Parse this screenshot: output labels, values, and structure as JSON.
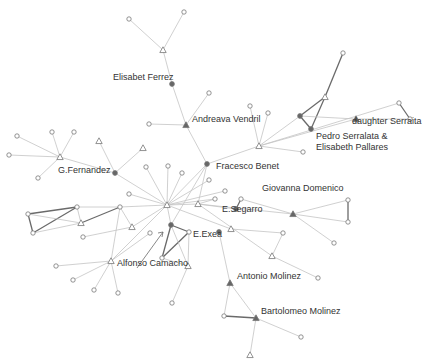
{
  "diagram": {
    "type": "social-network",
    "colors": {
      "edge_light": "#c4c4c4",
      "edge_dark": "#6a6a6a",
      "node_stroke": "#777777",
      "node_fill_dark": "#666666",
      "label": "#333333"
    },
    "labels": [
      {
        "id": "elisabet_ferrez",
        "text": "Elisabet Ferrez",
        "x": 113,
        "y": 78
      },
      {
        "id": "andreava_vendril",
        "text": "Andreava Vendril",
        "x": 192,
        "y": 120
      },
      {
        "id": "pedro_elisabeth_1",
        "text": "Pedro Serralata &",
        "x": 316,
        "y": 137
      },
      {
        "id": "pedro_elisabeth_2",
        "text": "Elisabeth Pallares",
        "x": 316,
        "y": 148
      },
      {
        "id": "daughter_serralta",
        "text": "daughter Serraita",
        "x": 352,
        "y": 122
      },
      {
        "id": "g_fernandez",
        "text": "G.Fernandez",
        "x": 58,
        "y": 171
      },
      {
        "id": "fracesco_benet",
        "text": "Fracesco Benet",
        "x": 216,
        "y": 167
      },
      {
        "id": "giovanna_domenico",
        "text": "Giovanna Domenico",
        "x": 262,
        "y": 189
      },
      {
        "id": "e_segarro",
        "text": "E.Segarro",
        "x": 222,
        "y": 210
      },
      {
        "id": "e_exea",
        "text": "E.Exea",
        "x": 193,
        "y": 235
      },
      {
        "id": "alfonso_camacho",
        "text": "Alfonso Camacho",
        "x": 117,
        "y": 264
      },
      {
        "id": "antonio_molinez",
        "text": "Antonio Molinez",
        "x": 237,
        "y": 277
      },
      {
        "id": "bartolomeo_molinez",
        "text": "Bartolomeo Molinez",
        "x": 261,
        "y": 312
      }
    ],
    "nodes": [
      {
        "id": "n1",
        "shape": "circle",
        "x": 129,
        "y": 19
      },
      {
        "id": "n2",
        "shape": "circle",
        "x": 184,
        "y": 12
      },
      {
        "id": "n3",
        "shape": "triangle",
        "x": 163,
        "y": 50
      },
      {
        "id": "elisabet",
        "shape": "dot",
        "x": 172,
        "y": 84
      },
      {
        "id": "andreava",
        "shape": "filled-triangle",
        "x": 186,
        "y": 125
      },
      {
        "id": "n4",
        "shape": "circle",
        "x": 149,
        "y": 124
      },
      {
        "id": "n5",
        "shape": "circle",
        "x": 209,
        "y": 93
      },
      {
        "id": "fracesco",
        "shape": "dot",
        "x": 207,
        "y": 164
      },
      {
        "id": "hub2",
        "shape": "triangle",
        "x": 259,
        "y": 146
      },
      {
        "id": "n6",
        "shape": "circle",
        "x": 250,
        "y": 106
      },
      {
        "id": "n7",
        "shape": "circle",
        "x": 268,
        "y": 113
      },
      {
        "id": "n8",
        "shape": "circle",
        "x": 303,
        "y": 152
      },
      {
        "id": "pedro",
        "shape": "dot",
        "x": 300,
        "y": 116
      },
      {
        "id": "elisabeth_p",
        "shape": "dot",
        "x": 311,
        "y": 129
      },
      {
        "id": "n9",
        "shape": "triangle",
        "x": 325,
        "y": 97
      },
      {
        "id": "n10",
        "shape": "circle",
        "x": 343,
        "y": 53
      },
      {
        "id": "daughter",
        "shape": "filled-triangle",
        "x": 356,
        "y": 119
      },
      {
        "id": "n11",
        "shape": "circle",
        "x": 399,
        "y": 103
      },
      {
        "id": "n12",
        "shape": "circle",
        "x": 410,
        "y": 119
      },
      {
        "id": "gfern",
        "shape": "triangle",
        "x": 60,
        "y": 157
      },
      {
        "id": "n13",
        "shape": "circle",
        "x": 17,
        "y": 136
      },
      {
        "id": "n14",
        "shape": "circle",
        "x": 9,
        "y": 155
      },
      {
        "id": "n15",
        "shape": "circle",
        "x": 52,
        "y": 132
      },
      {
        "id": "n16",
        "shape": "circle",
        "x": 74,
        "y": 132
      },
      {
        "id": "n17",
        "shape": "circle",
        "x": 38,
        "y": 178
      },
      {
        "id": "n18",
        "shape": "dot",
        "x": 115,
        "y": 173
      },
      {
        "id": "n19",
        "shape": "triangle",
        "x": 99,
        "y": 141
      },
      {
        "id": "n20",
        "shape": "triangle",
        "x": 143,
        "y": 148
      },
      {
        "id": "n21",
        "shape": "circle",
        "x": 146,
        "y": 167
      },
      {
        "id": "n22",
        "shape": "circle",
        "x": 168,
        "y": 166
      },
      {
        "id": "hub1",
        "shape": "triangle",
        "x": 167,
        "y": 205
      },
      {
        "id": "n23",
        "shape": "triangle",
        "x": 198,
        "y": 204
      },
      {
        "id": "n24",
        "shape": "circle",
        "x": 129,
        "y": 194
      },
      {
        "id": "n25",
        "shape": "circle",
        "x": 215,
        "y": 199
      },
      {
        "id": "n26",
        "shape": "circle",
        "x": 225,
        "y": 191
      },
      {
        "id": "n27",
        "shape": "circle",
        "x": 209,
        "y": 180
      },
      {
        "id": "n28",
        "shape": "circle",
        "x": 182,
        "y": 173
      },
      {
        "id": "n29",
        "shape": "circle",
        "x": 28,
        "y": 214
      },
      {
        "id": "n30",
        "shape": "circle",
        "x": 33,
        "y": 233
      },
      {
        "id": "n31",
        "shape": "circle",
        "x": 77,
        "y": 207
      },
      {
        "id": "n32",
        "shape": "triangle",
        "x": 81,
        "y": 223
      },
      {
        "id": "n33",
        "shape": "circle",
        "x": 120,
        "y": 207
      },
      {
        "id": "n34",
        "shape": "triangle",
        "x": 132,
        "y": 227
      },
      {
        "id": "n35",
        "shape": "circle",
        "x": 83,
        "y": 237
      },
      {
        "id": "n36",
        "shape": "circle",
        "x": 150,
        "y": 233
      },
      {
        "id": "n37",
        "shape": "triangle",
        "x": 111,
        "y": 261
      },
      {
        "id": "n38",
        "shape": "circle",
        "x": 56,
        "y": 266
      },
      {
        "id": "n39",
        "shape": "circle",
        "x": 73,
        "y": 280
      },
      {
        "id": "n40",
        "shape": "circle",
        "x": 94,
        "y": 290
      },
      {
        "id": "n41",
        "shape": "circle",
        "x": 118,
        "y": 293
      },
      {
        "id": "n42",
        "shape": "dot",
        "x": 171,
        "y": 225
      },
      {
        "id": "n43",
        "shape": "circle",
        "x": 189,
        "y": 232
      },
      {
        "id": "n44",
        "shape": "circle",
        "x": 162,
        "y": 258
      },
      {
        "id": "n45",
        "shape": "triangle",
        "x": 188,
        "y": 266
      },
      {
        "id": "n46",
        "shape": "circle",
        "x": 172,
        "y": 303
      },
      {
        "id": "exea",
        "shape": "dot",
        "x": 219,
        "y": 232
      },
      {
        "id": "segarro",
        "shape": "dot",
        "x": 236,
        "y": 209
      },
      {
        "id": "n47",
        "shape": "triangle",
        "x": 231,
        "y": 229
      },
      {
        "id": "n48",
        "shape": "circle",
        "x": 241,
        "y": 199
      },
      {
        "id": "giovanna",
        "shape": "filled-triangle",
        "x": 293,
        "y": 214
      },
      {
        "id": "n49",
        "shape": "circle",
        "x": 348,
        "y": 200
      },
      {
        "id": "n50",
        "shape": "circle",
        "x": 348,
        "y": 222
      },
      {
        "id": "n51",
        "shape": "circle",
        "x": 334,
        "y": 243
      },
      {
        "id": "n52",
        "shape": "circle",
        "x": 283,
        "y": 233
      },
      {
        "id": "n53",
        "shape": "triangle",
        "x": 272,
        "y": 256
      },
      {
        "id": "n54",
        "shape": "circle",
        "x": 318,
        "y": 278
      },
      {
        "id": "antonio",
        "shape": "filled-triangle",
        "x": 230,
        "y": 283
      },
      {
        "id": "n55",
        "shape": "circle",
        "x": 224,
        "y": 316
      },
      {
        "id": "bartolomeo",
        "shape": "filled-triangle",
        "x": 256,
        "y": 318
      },
      {
        "id": "n56",
        "shape": "circle",
        "x": 301,
        "y": 337
      },
      {
        "id": "n57",
        "shape": "triangle",
        "x": 250,
        "y": 355
      }
    ],
    "edges": [
      [
        "n1",
        "n3",
        0
      ],
      [
        "n2",
        "n3",
        0
      ],
      [
        "n3",
        "elisabet",
        0
      ],
      [
        "elisabet",
        "andreava",
        0
      ],
      [
        "n4",
        "andreava",
        0
      ],
      [
        "n5",
        "andreava",
        0
      ],
      [
        "andreava",
        "fracesco",
        0
      ],
      [
        "fracesco",
        "hub2",
        0
      ],
      [
        "hub2",
        "n6",
        0
      ],
      [
        "hub2",
        "n7",
        0
      ],
      [
        "hub2",
        "n8",
        0
      ],
      [
        "hub2",
        "pedro",
        0
      ],
      [
        "hub2",
        "daughter",
        0
      ],
      [
        "pedro",
        "elisabeth_p",
        1
      ],
      [
        "pedro",
        "n9",
        1
      ],
      [
        "elisabeth_p",
        "n9",
        1
      ],
      [
        "n9",
        "n10",
        1
      ],
      [
        "pedro",
        "daughter",
        0
      ],
      [
        "daughter",
        "n12",
        0
      ],
      [
        "n11",
        "n12",
        1
      ],
      [
        "hub2",
        "n11",
        0
      ],
      [
        "gfern",
        "n13",
        0
      ],
      [
        "gfern",
        "n14",
        0
      ],
      [
        "gfern",
        "n15",
        0
      ],
      [
        "gfern",
        "n16",
        0
      ],
      [
        "gfern",
        "n17",
        0
      ],
      [
        "gfern",
        "n18",
        0
      ],
      [
        "n18",
        "n19",
        0
      ],
      [
        "n18",
        "n20",
        0
      ],
      [
        "n18",
        "hub1",
        0
      ],
      [
        "fracesco",
        "hub1",
        0
      ],
      [
        "fracesco",
        "n23",
        0
      ],
      [
        "fracesco",
        "n42",
        0
      ],
      [
        "hub1",
        "n21",
        0
      ],
      [
        "hub1",
        "n22",
        0
      ],
      [
        "hub1",
        "n24",
        0
      ],
      [
        "hub1",
        "n25",
        0
      ],
      [
        "hub1",
        "n26",
        0
      ],
      [
        "hub1",
        "n27",
        0
      ],
      [
        "hub1",
        "n28",
        0
      ],
      [
        "hub1",
        "n23",
        0
      ],
      [
        "hub1",
        "n33",
        0
      ],
      [
        "hub1",
        "n34",
        0
      ],
      [
        "hub1",
        "n37",
        0
      ],
      [
        "hub1",
        "n42",
        0
      ],
      [
        "n29",
        "n31",
        1
      ],
      [
        "n29",
        "n30",
        1
      ],
      [
        "n30",
        "n31",
        1
      ],
      [
        "n31",
        "n33",
        0
      ],
      [
        "n31",
        "n32",
        0
      ],
      [
        "n32",
        "n33",
        1
      ],
      [
        "n29",
        "n32",
        0
      ],
      [
        "n30",
        "n32",
        0
      ],
      [
        "n33",
        "n34",
        0
      ],
      [
        "n33",
        "n37",
        0
      ],
      [
        "n35",
        "n34",
        0
      ],
      [
        "n37",
        "n38",
        0
      ],
      [
        "n37",
        "n39",
        0
      ],
      [
        "n37",
        "n40",
        0
      ],
      [
        "n37",
        "n41",
        0
      ],
      [
        "n37",
        "n36",
        0
      ],
      [
        "n42",
        "n43",
        1
      ],
      [
        "n42",
        "n44",
        1
      ],
      [
        "n44",
        "n43",
        1
      ],
      [
        "n42",
        "n45",
        0
      ],
      [
        "n43",
        "n45",
        0
      ],
      [
        "n44",
        "n45",
        0
      ],
      [
        "n45",
        "n46",
        0
      ],
      [
        "n23",
        "n25",
        0
      ],
      [
        "n23",
        "segarro",
        0
      ],
      [
        "segarro",
        "n48",
        1
      ],
      [
        "n48",
        "giovanna",
        0
      ],
      [
        "n23",
        "giovanna",
        0
      ],
      [
        "giovanna",
        "n49",
        0
      ],
      [
        "giovanna",
        "n50",
        0
      ],
      [
        "n49",
        "n50",
        1
      ],
      [
        "giovanna",
        "n51",
        0
      ],
      [
        "hub1",
        "n47",
        0
      ],
      [
        "n47",
        "n52",
        0
      ],
      [
        "n52",
        "n53",
        0
      ],
      [
        "n23",
        "n53",
        0
      ],
      [
        "n53",
        "n54",
        0
      ],
      [
        "exea",
        "antonio",
        0
      ],
      [
        "antonio",
        "n55",
        0
      ],
      [
        "antonio",
        "bartolomeo",
        0
      ],
      [
        "n55",
        "bartolomeo",
        1
      ],
      [
        "bartolomeo",
        "n56",
        0
      ],
      [
        "bartolomeo",
        "n57",
        0
      ]
    ],
    "arrow": {
      "from": [
        137,
        268
      ],
      "to": [
        163,
        232
      ]
    }
  }
}
